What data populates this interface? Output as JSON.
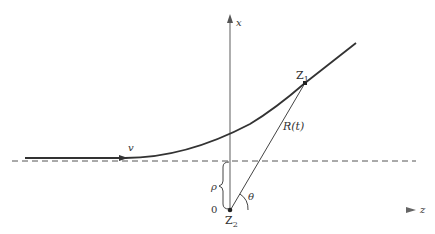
{
  "diagram": {
    "labels": {
      "x_axis": "x",
      "z_axis": "z",
      "velocity": "v",
      "particle1": "Z",
      "particle1_sub": "1",
      "particle2": "Z",
      "particle2_sub": "2",
      "separation": "R(t)",
      "impact_parameter": "ρ",
      "angle": "θ",
      "origin": "0"
    },
    "colors": {
      "line": "#333333",
      "axis": "#777777",
      "dashed": "#555555",
      "z_axis_gradient_start": "#4a8a80",
      "z_axis_gradient_mid": "#d08080",
      "z_axis_gradient_end": "#999999"
    }
  }
}
